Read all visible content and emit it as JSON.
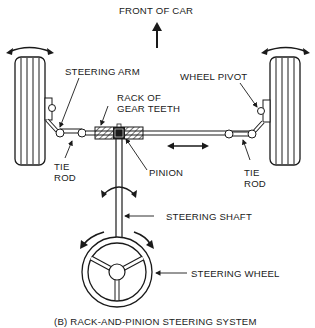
{
  "diagram": {
    "title": "(B)  RACK-AND-PINION STEERING SYSTEM",
    "direction_label": "FRONT OF CAR",
    "labels": {
      "steering_arm": "STEERING ARM",
      "rack_line1": "RACK OF",
      "rack_line2": "GEAR TEETH",
      "wheel_pivot": "WHEEL PIVOT",
      "pinion": "PINION",
      "tie_rod_left_line1": "TIE",
      "tie_rod_left_line2": "ROD",
      "tie_rod_right_line1": "TIE",
      "tie_rod_right_line2": "ROD",
      "steering_shaft": "STEERING SHAFT",
      "steering_wheel": "STEERING WHEEL"
    },
    "colors": {
      "line": "#1a1a1a",
      "background": "#ffffff"
    }
  }
}
